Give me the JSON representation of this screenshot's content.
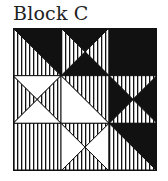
{
  "title": "Block C",
  "colors": {
    "ink": "#111111",
    "paper": "#ffffff"
  },
  "grid": {
    "rows": 3,
    "cols": 3,
    "cells": [
      {
        "row": 0,
        "col": 0,
        "type": "half-diag-tl-br",
        "upper": "black",
        "lower": "stripe"
      },
      {
        "row": 0,
        "col": 1,
        "type": "quarter-x",
        "top": "black",
        "right": "stripe",
        "bottom": "black",
        "left": "stripe"
      },
      {
        "row": 0,
        "col": 2,
        "type": "solid",
        "fill": "black"
      },
      {
        "row": 1,
        "col": 0,
        "type": "quarter-x",
        "top": "white",
        "right": "stripe",
        "bottom": "white",
        "left": "stripe"
      },
      {
        "row": 1,
        "col": 1,
        "type": "half-diag-tl-br",
        "upper": "stripe",
        "lower": "white"
      },
      {
        "row": 1,
        "col": 2,
        "type": "quarter-x",
        "top": "stripe",
        "right": "black",
        "bottom": "stripe",
        "left": "black"
      },
      {
        "row": 2,
        "col": 0,
        "type": "solid",
        "fill": "stripe"
      },
      {
        "row": 2,
        "col": 1,
        "type": "quarter-x",
        "top": "stripe",
        "right": "white",
        "bottom": "stripe",
        "left": "white"
      },
      {
        "row": 2,
        "col": 2,
        "type": "half-diag-tl-br",
        "upper": "black",
        "lower": "stripe"
      }
    ]
  }
}
